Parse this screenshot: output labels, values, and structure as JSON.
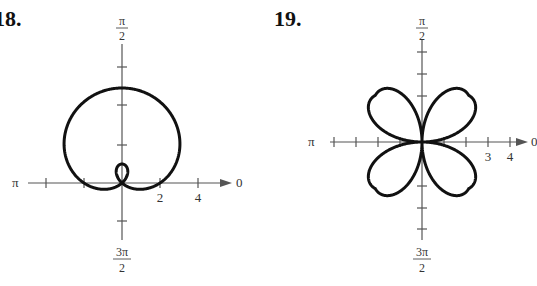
{
  "chart_data": [
    {
      "type": "polar-line",
      "problem_number": "18.",
      "equation_inferred": "r = 2 + 3 sin θ",
      "title": "",
      "angle_labels": {
        "top": "π/2",
        "left": "π",
        "right": "0",
        "bottom": "3π/2"
      },
      "tick_labels": [
        "2",
        "4"
      ],
      "radial_tick_step": 1,
      "grid": false,
      "shape": "limaçon with inner loop",
      "points": [
        [
          0,
          2
        ],
        [
          90,
          5
        ],
        [
          180,
          2
        ],
        [
          270,
          -1
        ]
      ]
    },
    {
      "type": "polar-line",
      "problem_number": "19.",
      "equation_inferred": "r = 3 sin 2θ (four-petal rose)",
      "title": "",
      "angle_labels": {
        "top": "π/2",
        "left": "π",
        "right": "0",
        "bottom": "3π/2"
      },
      "tick_labels": [
        "3",
        "4"
      ],
      "radial_tick_step": 1,
      "grid": false,
      "shape": "four-petal rose, petals in each quadrant",
      "points": [
        [
          0,
          0
        ],
        [
          45,
          3
        ],
        [
          90,
          0
        ],
        [
          135,
          -3
        ],
        [
          180,
          0
        ]
      ]
    }
  ],
  "figure18": {
    "number": "18.",
    "labels": {
      "top_num": "π",
      "top_den": "2",
      "left": "π",
      "right": "0",
      "bottom_num": "3π",
      "bottom_den": "2"
    },
    "ticks": {
      "t1": "2",
      "t2": "4"
    }
  },
  "figure19": {
    "number": "19.",
    "labels": {
      "top_num": "π",
      "top_den": "2",
      "left": "π",
      "right": "0",
      "bottom_num": "3π",
      "bottom_den": "2"
    },
    "ticks": {
      "t1": "3",
      "t2": "4"
    }
  }
}
